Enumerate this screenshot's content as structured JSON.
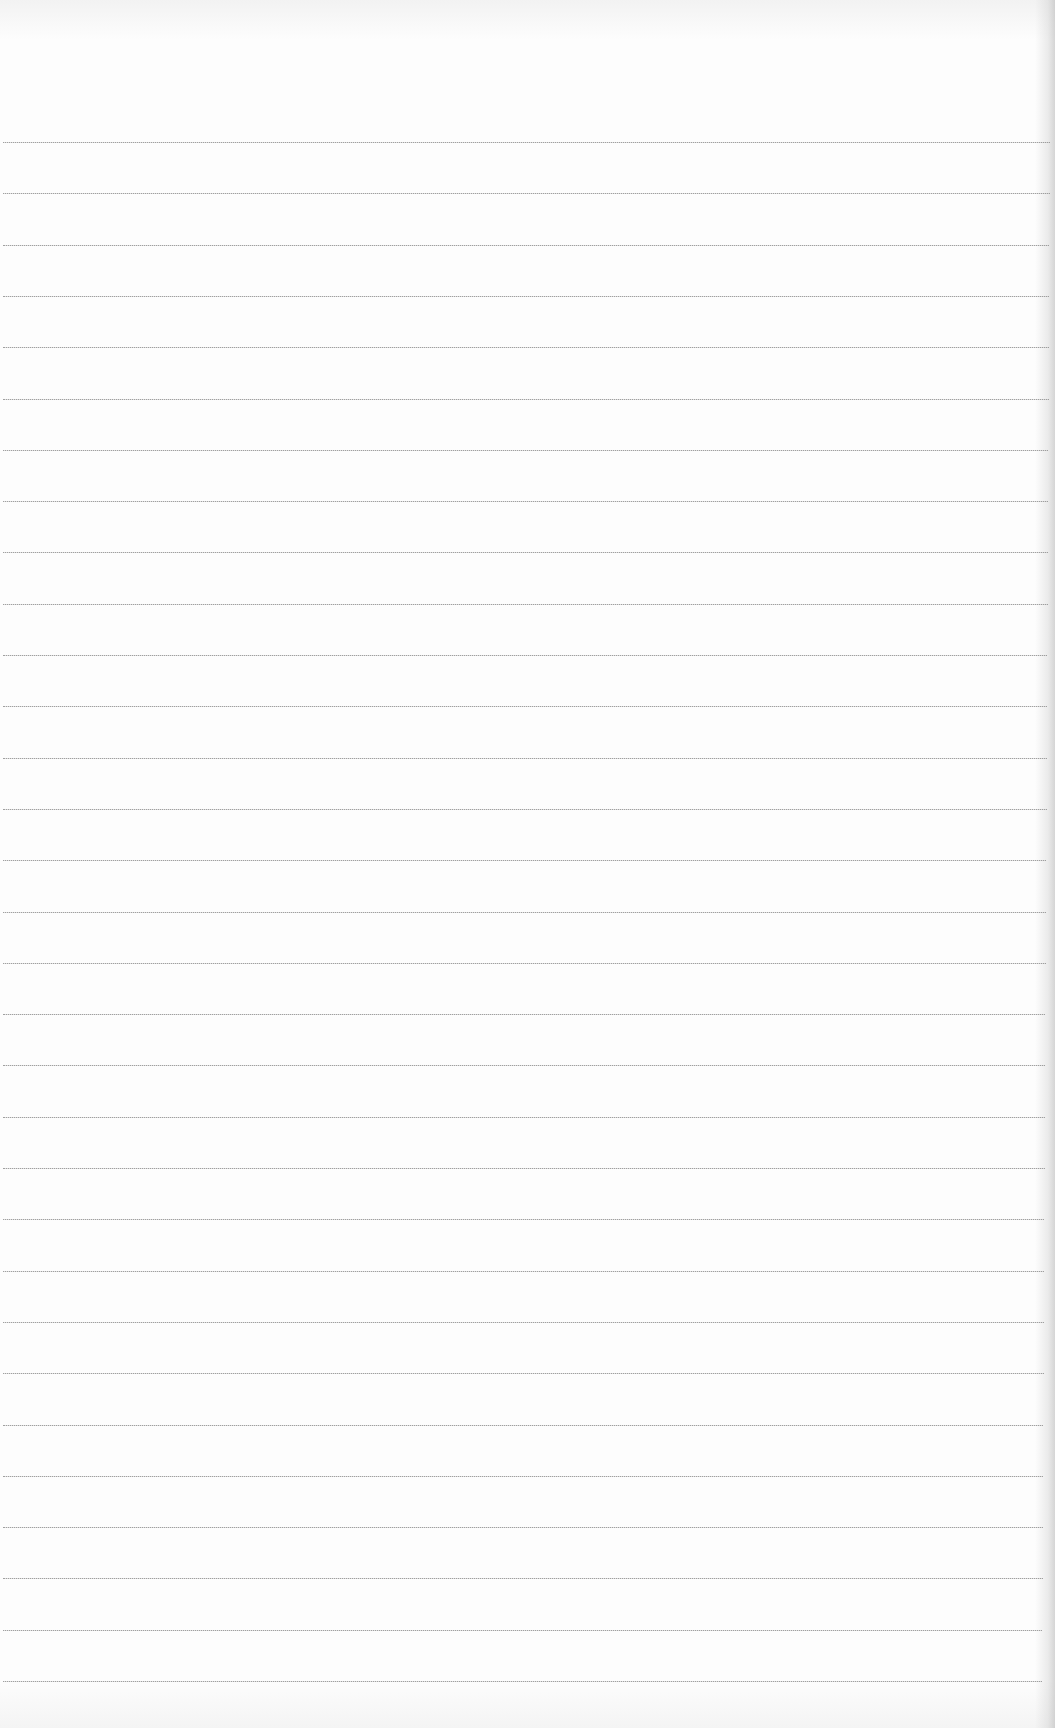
{
  "paper": {
    "type": "lined-paper",
    "background_color": "#fdfdfd",
    "line_color": "#8e8e8e",
    "line_count": 31,
    "first_line_y": 142,
    "line_spacing": 51.3,
    "line_left_x": 3,
    "line_right_x_top": 1050,
    "line_right_x_bottom": 1042,
    "text": ""
  }
}
